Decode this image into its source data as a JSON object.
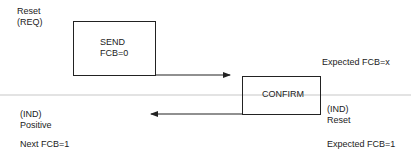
{
  "diagram": {
    "top_left_label": {
      "line1": "Reset",
      "line2": "(REQ)"
    },
    "send_box": {
      "line1": "SEND",
      "line2": "FCB=0"
    },
    "confirm_box": {
      "label": "CONFIRM"
    },
    "right_top_label": "Expected FCB=x",
    "left_ind_label": {
      "line1": "(IND)",
      "line2": "Positive"
    },
    "right_ind_label": {
      "line1": "(IND)",
      "line2": "Reset"
    },
    "bottom_left_label": "Next FCB=1",
    "bottom_right_label": "Expected FCB=1",
    "colors": {
      "line": "#222222",
      "separator": "#c8c8c8",
      "background": "#ffffff"
    }
  }
}
